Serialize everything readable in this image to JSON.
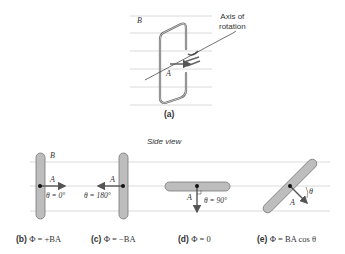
{
  "panel_a": {
    "field_label": "B",
    "axis_label_line1": "Axis of",
    "axis_label_line2": "rotation",
    "area_label": "A",
    "caption": "(a)"
  },
  "side_view_label": "Side view",
  "field_label": "B",
  "panels": [
    {
      "id": "b",
      "caption_letter": "(b)",
      "caption_eq": "Φ = +BA",
      "area_label": "A",
      "angle_label": "θ = 0°"
    },
    {
      "id": "c",
      "caption_letter": "(c)",
      "caption_eq": "Φ = −BA",
      "area_label": "A",
      "angle_label": "θ = 180°"
    },
    {
      "id": "d",
      "caption_letter": "(d)",
      "caption_eq": "Φ = 0",
      "area_label": "A",
      "angle_label": "θ = 90°"
    },
    {
      "id": "e",
      "caption_letter": "(e)",
      "caption_eq": "Φ = BA cos θ",
      "area_label": "A",
      "angle_label": "θ"
    }
  ],
  "colors": {
    "field_line": "#cccccc",
    "loop_fill": "#bdbdbd",
    "loop_stroke": "#777777",
    "arrow": "#555555",
    "text": "#333333"
  }
}
